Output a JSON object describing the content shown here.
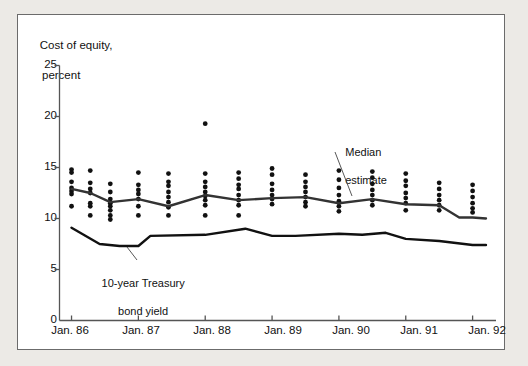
{
  "figure": {
    "background_color": "#eceae6",
    "panel_color": "#ffffff",
    "border_color": "#6b6b6b",
    "ink_color": "#1a1a1a"
  },
  "annotations": {
    "median_estimate": {
      "line1": "Median",
      "line2": "estimate"
    },
    "treasury": {
      "line1": "10-year Treasury",
      "line2": "bond yield"
    }
  },
  "chart_data": {
    "type": "scatter",
    "title": "",
    "ylabel_line1": "Cost of equity,",
    "ylabel_line2": "percent",
    "xlabel": "",
    "ylim": [
      0,
      25
    ],
    "yticks": [
      0,
      5,
      10,
      15,
      20,
      25
    ],
    "ytick_labels": [
      "0",
      "5",
      "10",
      "15",
      "20",
      "25"
    ],
    "grid": false,
    "legend_position": "none",
    "xtick_labels": [
      "Jan. 86",
      "Jan. 87",
      "Jan. 88",
      "Jan. 89",
      "Jan. 90",
      "Jan. 91",
      "Jan. 92"
    ],
    "xtick_values": [
      1986.0,
      1987.0,
      1988.0,
      1989.0,
      1990.0,
      1991.0,
      1992.0
    ],
    "xlim": [
      1985.82,
      1992.35
    ],
    "scatter_series": {
      "name": "Individual cost-of-equity estimates",
      "marker": "filled-circle",
      "color": "#111111",
      "columns": [
        {
          "x": 1986.0,
          "values": [
            14.8,
            14.5,
            13.6,
            13.0,
            12.7,
            12.4,
            11.2
          ]
        },
        {
          "x": 1986.28,
          "values": [
            14.7,
            13.5,
            12.9,
            12.5,
            11.5,
            11.2,
            10.3
          ]
        },
        {
          "x": 1986.58,
          "values": [
            13.4,
            12.6,
            11.9,
            11.5,
            11.2,
            10.8,
            10.3,
            9.9
          ]
        },
        {
          "x": 1987.0,
          "values": [
            14.5,
            13.3,
            12.8,
            12.4,
            11.9,
            11.2,
            10.3
          ]
        },
        {
          "x": 1987.45,
          "values": [
            14.4,
            13.6,
            13.2,
            12.6,
            12.1,
            11.6,
            11.1,
            10.3
          ]
        },
        {
          "x": 1988.0,
          "values": [
            19.3,
            14.4,
            13.6,
            13.1,
            12.6,
            12.2,
            11.8,
            11.3,
            10.3
          ]
        },
        {
          "x": 1988.5,
          "values": [
            14.5,
            13.9,
            13.3,
            12.9,
            12.3,
            11.8,
            11.3,
            10.3
          ]
        },
        {
          "x": 1989.0,
          "values": [
            14.9,
            14.3,
            13.4,
            12.8,
            12.3,
            11.9,
            11.4
          ]
        },
        {
          "x": 1989.5,
          "values": [
            14.3,
            13.6,
            13.1,
            12.6,
            12.1,
            11.6,
            11.2
          ]
        },
        {
          "x": 1990.0,
          "values": [
            14.7,
            13.8,
            13.0,
            12.3,
            11.7,
            11.2,
            10.7
          ]
        },
        {
          "x": 1990.5,
          "values": [
            14.6,
            14.0,
            13.4,
            12.8,
            12.3,
            11.8,
            11.3
          ]
        },
        {
          "x": 1991.0,
          "values": [
            14.4,
            13.7,
            13.2,
            12.5,
            12.0,
            11.5,
            10.8
          ]
        },
        {
          "x": 1991.5,
          "values": [
            13.5,
            12.9,
            12.3,
            11.8,
            11.3,
            10.8
          ]
        },
        {
          "x": 1992.0,
          "values": [
            13.3,
            12.7,
            12.1,
            11.5,
            11.0,
            10.6
          ]
        }
      ]
    },
    "line_series": [
      {
        "name": "Median estimate",
        "color": "#333333",
        "width": 2.4,
        "points": [
          [
            1986.0,
            12.9
          ],
          [
            1986.28,
            12.5
          ],
          [
            1986.58,
            11.6
          ],
          [
            1987.0,
            11.9
          ],
          [
            1987.45,
            11.2
          ],
          [
            1988.0,
            12.3
          ],
          [
            1988.5,
            11.8
          ],
          [
            1989.0,
            12.0
          ],
          [
            1989.5,
            12.1
          ],
          [
            1990.0,
            11.5
          ],
          [
            1990.5,
            11.9
          ],
          [
            1991.0,
            11.4
          ],
          [
            1991.5,
            11.3
          ],
          [
            1991.8,
            10.1
          ],
          [
            1992.0,
            10.1
          ],
          [
            1992.2,
            10.0
          ]
        ]
      },
      {
        "name": "10-year Treasury bond yield",
        "color": "#111111",
        "width": 2.4,
        "points": [
          [
            1986.0,
            9.1
          ],
          [
            1986.42,
            7.5
          ],
          [
            1986.72,
            7.3
          ],
          [
            1987.0,
            7.3
          ],
          [
            1987.18,
            8.3
          ],
          [
            1988.0,
            8.4
          ],
          [
            1988.6,
            9.0
          ],
          [
            1989.0,
            8.3
          ],
          [
            1989.35,
            8.3
          ],
          [
            1990.0,
            8.5
          ],
          [
            1990.35,
            8.4
          ],
          [
            1990.7,
            8.6
          ],
          [
            1991.0,
            8.0
          ],
          [
            1991.5,
            7.8
          ],
          [
            1992.0,
            7.4
          ],
          [
            1992.2,
            7.4
          ]
        ]
      }
    ]
  }
}
